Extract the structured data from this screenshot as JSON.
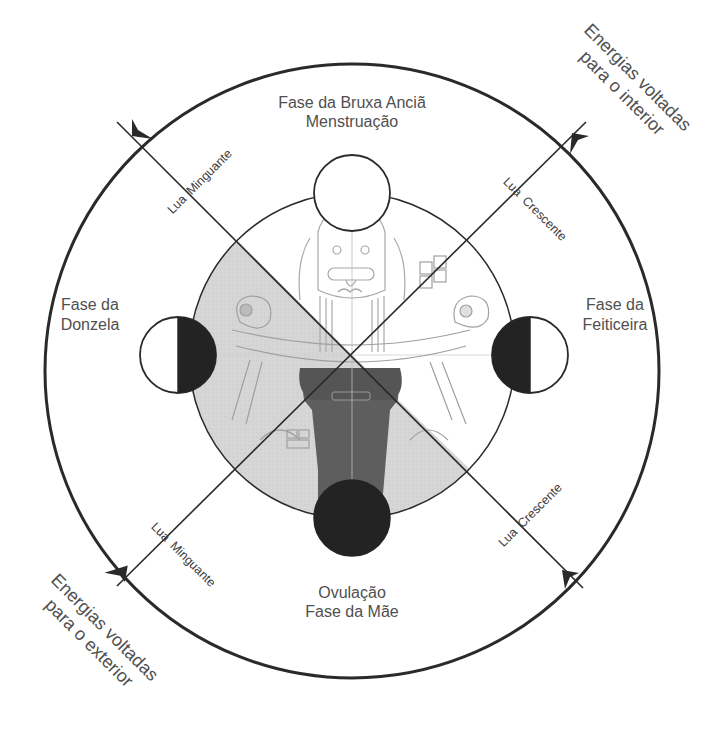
{
  "diagram": {
    "type": "moon-cycle-phases",
    "phases": {
      "top": {
        "line1": "Fase da Bruxa Anciã",
        "line2": "Menstruação",
        "moon": "full-white"
      },
      "left": {
        "line1": "Fase da",
        "line2": "Donzela",
        "moon": "right-half-dark"
      },
      "right": {
        "line1": "Fase da",
        "line2": "Feiticeira",
        "moon": "left-half-dark"
      },
      "bottom": {
        "line1": "Ovulação",
        "line2": "Fase da Mãe",
        "moon": "full-dark"
      }
    },
    "axis_labels": {
      "top_left": {
        "part1": "Lua",
        "part2": "Minguante"
      },
      "top_right": {
        "part1": "Lua",
        "part2": "Crescente"
      },
      "bottom_left": {
        "part1": "Lua",
        "part2": "Minguante"
      },
      "bottom_right": {
        "part1": "Lua",
        "part2": "Crescente"
      }
    },
    "energy_labels": {
      "inward": {
        "line1": "Energias voltadas",
        "line2": "para o interior"
      },
      "outward": {
        "line1": "Energias voltadas",
        "line2": "para o exterior"
      }
    },
    "colors": {
      "line": "#2a2a2a",
      "text": "#4a4a4a",
      "dark_moon": "#232323",
      "shaded_quadrant": "#d3d3d3",
      "robe": "#5a5a5a",
      "background": "#ffffff"
    },
    "central_illustration": "goddess-figure"
  }
}
